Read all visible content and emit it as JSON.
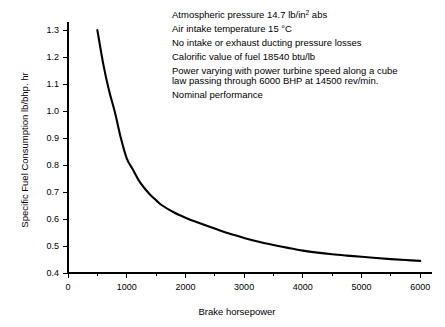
{
  "chart_data": {
    "type": "line",
    "title": "",
    "xlabel": "Brake horsepower",
    "ylabel": "Specific Fuel Consumption  lb/bhp. hr",
    "xlim": [
      0,
      6200
    ],
    "ylim": [
      0.4,
      1.33
    ],
    "grid": false,
    "legend": "none",
    "xticks": [
      0,
      1000,
      2000,
      3000,
      4000,
      5000,
      6000
    ],
    "xtick_labels": [
      "0",
      "1000",
      "2000",
      "3000",
      "4000",
      "5000",
      "6000"
    ],
    "xminor_ticks": [
      500,
      1500,
      2500,
      3500,
      4500,
      5500
    ],
    "yticks": [
      0.4,
      0.5,
      0.6,
      0.7,
      0.8,
      0.9,
      1.0,
      1.1,
      1.2,
      1.3
    ],
    "ytick_labels": [
      "0.4",
      "0.5",
      "0.6",
      "0.7",
      "0.8",
      "0.9",
      "1.0",
      "1.1",
      "1.2",
      "1.3"
    ],
    "series": [
      {
        "name": "Specific fuel consumption",
        "x": [
          500,
          600,
          700,
          800,
          900,
          1000,
          1100,
          1200,
          1300,
          1400,
          1500,
          1600,
          1800,
          2000,
          2200,
          2400,
          2600,
          2800,
          3000,
          3250,
          3500,
          3750,
          4000,
          4250,
          4500,
          4750,
          5000,
          5250,
          5500,
          5750,
          6000
        ],
        "y": [
          1.3,
          1.175,
          1.075,
          0.995,
          0.9,
          0.825,
          0.785,
          0.745,
          0.715,
          0.69,
          0.67,
          0.651,
          0.625,
          0.605,
          0.588,
          0.572,
          0.557,
          0.543,
          0.53,
          0.516,
          0.504,
          0.493,
          0.483,
          0.4755,
          0.4695,
          0.4645,
          0.46,
          0.4555,
          0.4515,
          0.448,
          0.445
        ]
      }
    ]
  },
  "annotations": {
    "lines": [
      {
        "text_before": "Atmospheric pressure 14.7 lb/in",
        "sup": "2",
        "text_after": " abs"
      },
      {
        "text_before": "Air intake temperature 15 °C",
        "sup": "",
        "text_after": ""
      },
      {
        "text_before": "No intake or exhaust ducting pressure losses",
        "sup": "",
        "text_after": ""
      },
      {
        "text_before": "Calorific value of fuel 18540 btu/lb",
        "sup": "",
        "text_after": ""
      },
      {
        "text_before": "Power varying with power turbine speed along a cube",
        "sup": "",
        "text_after": ""
      },
      {
        "text_before": "law passing through 6000 BHP at 14500 rev/min.",
        "sup": "",
        "text_after": ""
      },
      {
        "text_before": "Nominal performance",
        "sup": "",
        "text_after": ""
      }
    ]
  },
  "colors": {
    "background": "#ffffff",
    "ink": "#000000",
    "curve": "#000000"
  }
}
